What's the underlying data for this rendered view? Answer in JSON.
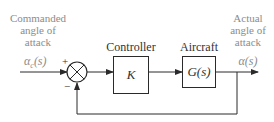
{
  "diagram": {
    "type": "feedback-control-block-diagram",
    "input": {
      "label_lines": [
        "Commanded",
        "angle of",
        "attack"
      ],
      "symbol": "αc(s)",
      "symbol_main": "α",
      "symbol_sub": "c",
      "symbol_arg": "(s)"
    },
    "summing_junction": {
      "plus_sign": "+",
      "minus_sign": "−"
    },
    "controller": {
      "title": "Controller",
      "content": "K"
    },
    "plant": {
      "title": "Aircraft",
      "content": "G(s)"
    },
    "output": {
      "label_lines": [
        "Actual",
        "angle of",
        "attack"
      ],
      "symbol": "α(s)"
    },
    "colors": {
      "line": "#2a2a2a",
      "label_text": "#8c8c8c",
      "block_text": "#333333"
    }
  }
}
